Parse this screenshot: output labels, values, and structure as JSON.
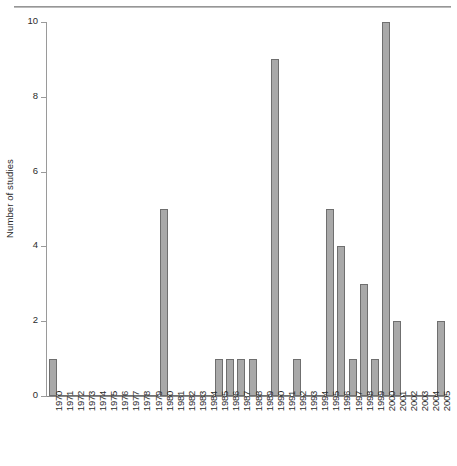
{
  "chart_data": {
    "type": "bar",
    "title": "",
    "subtitle": "",
    "xlabel": "",
    "ylabel": "Number of studies",
    "ylim": [
      0,
      10
    ],
    "yticks": [
      0,
      2,
      4,
      6,
      8,
      10
    ],
    "ytick_labels": [
      "0",
      "2",
      "4",
      "6",
      "8",
      "10"
    ],
    "grid": false,
    "legend": null,
    "bar_color": "#a9a9a9",
    "bar_edge_color": "#6f6f6f",
    "categories": [
      "1970",
      "1971",
      "1972",
      "1973",
      "1974",
      "1975",
      "1976",
      "1977",
      "1978",
      "1979",
      "1980",
      "1981",
      "1982",
      "1983",
      "1984",
      "1985",
      "1986",
      "1987",
      "1988",
      "1989",
      "1990",
      "1991",
      "1992",
      "1993",
      "1994",
      "1995",
      "1996",
      "1997",
      "1998",
      "1999",
      "2000",
      "2001",
      "2002",
      "2003",
      "2004",
      "2005"
    ],
    "values": [
      1,
      0,
      0,
      0,
      0,
      0,
      0,
      0,
      0,
      0,
      5,
      0,
      0,
      0,
      0,
      1,
      1,
      1,
      1,
      0,
      9,
      0,
      1,
      0,
      0,
      5,
      4,
      1,
      3,
      1,
      10,
      2,
      0,
      0,
      0,
      2
    ]
  }
}
